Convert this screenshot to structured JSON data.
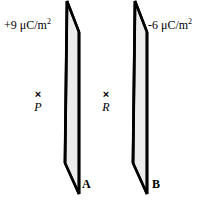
{
  "figure": {
    "background_color": "#ffffff",
    "plane_fill_color": "#ececec",
    "plane_edge_color": "#000000"
  },
  "planes": [
    {
      "name": "A",
      "charge_density_sign": "+",
      "charge_density_value": "9",
      "charge_density_label": "+9 μC/m",
      "charge_density_exponent": "2",
      "units": "μC/m²"
    },
    {
      "name": "B",
      "charge_density_sign": "-",
      "charge_density_value": "6",
      "charge_density_label": "-6 μC/m",
      "charge_density_exponent": "2",
      "units": "μC/m²"
    }
  ],
  "points": [
    {
      "name": "P",
      "marker": "×",
      "marker_icon": "cross-marker-icon"
    },
    {
      "name": "R",
      "marker": "×",
      "marker_icon": "cross-marker-icon"
    }
  ]
}
